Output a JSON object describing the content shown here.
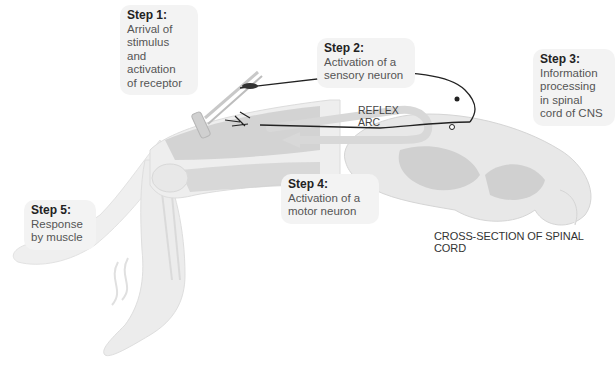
{
  "diagram": {
    "title": "Reflex arc",
    "steps": [
      {
        "step": "Step 1:",
        "description": "Arrival of\nstimulus and\nactivation\nof receptor"
      },
      {
        "step": "Step 2:",
        "description": "Activation of a\nsensory neuron"
      },
      {
        "step": "Step 3:",
        "description": "Information\nprocessing\nin spinal\ncord of CNS"
      },
      {
        "step": "Step 4:",
        "description": "Activation of a\nmotor neuron"
      },
      {
        "step": "Step 5:",
        "description": "Response\nby muscle"
      }
    ],
    "arc_label": "REFLEX\nARC",
    "caption": "CROSS-SECTION OF SPINAL CORD",
    "colors": {
      "callout_bg": "#f3f3f3",
      "skin": "#ececec",
      "muscle": "#c9c9c9",
      "spinal_white_matter": "#e6e6e6",
      "spinal_gray_matter": "#cfcfcf",
      "neuron_line": "#222222",
      "arc_arrow": "#d8d8d8"
    }
  }
}
